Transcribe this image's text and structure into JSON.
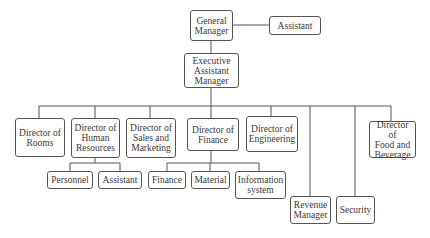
{
  "diagram": {
    "type": "org-chart",
    "nodes": [
      {
        "id": "gm",
        "label": "General\nManager",
        "parent": null
      },
      {
        "id": "gm_assistant",
        "label": "Assistant",
        "parent": "gm",
        "relation": "staff"
      },
      {
        "id": "eam",
        "label": "Executive\nAssistant\nManager",
        "parent": "gm"
      },
      {
        "id": "rooms",
        "label": "Director of\nRooms",
        "parent": "eam"
      },
      {
        "id": "hr",
        "label": "Director of\nHuman\nResources",
        "parent": "eam"
      },
      {
        "id": "sales",
        "label": "Director of\nSales and\nMarketing",
        "parent": "eam"
      },
      {
        "id": "finance",
        "label": "Director of\nFinance",
        "parent": "eam"
      },
      {
        "id": "engineering",
        "label": "Director of\nEngineering",
        "parent": "eam"
      },
      {
        "id": "revenue",
        "label": "Revenue\nManager",
        "parent": "eam"
      },
      {
        "id": "security",
        "label": "Security",
        "parent": "eam"
      },
      {
        "id": "fnb",
        "label": "Director of\nFood and\nBeverage",
        "parent": "eam"
      },
      {
        "id": "personnel",
        "label": "Personnel",
        "parent": "hr"
      },
      {
        "id": "hr_assistant",
        "label": "Assistant",
        "parent": "hr"
      },
      {
        "id": "fin_finance",
        "label": "Finance",
        "parent": "finance"
      },
      {
        "id": "material",
        "label": "Material",
        "parent": "finance"
      },
      {
        "id": "infosys",
        "label": "Information\nsystem",
        "parent": "finance"
      }
    ]
  }
}
